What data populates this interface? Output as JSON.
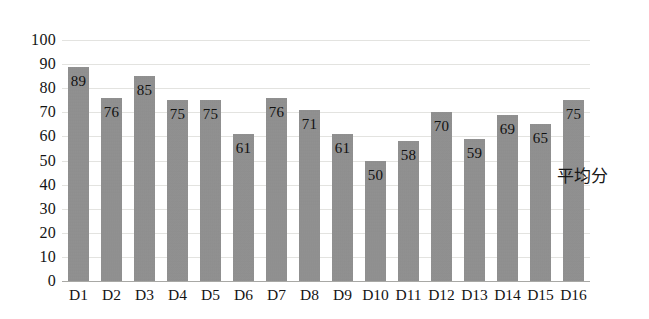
{
  "chart_data": {
    "type": "bar",
    "title": "",
    "subtitle": "",
    "xlabel": "",
    "ylabel": "",
    "categories": [
      "D1",
      "D2",
      "D3",
      "D4",
      "D5",
      "D6",
      "D7",
      "D8",
      "D9",
      "D10",
      "D11",
      "D12",
      "D13",
      "D14",
      "D15",
      "D16"
    ],
    "values": [
      89,
      76,
      85,
      75,
      75,
      61,
      76,
      71,
      61,
      50,
      58,
      70,
      59,
      69,
      65,
      75
    ],
    "series": [
      {
        "name": "平均分",
        "values": [
          89,
          76,
          85,
          75,
          75,
          61,
          76,
          71,
          61,
          50,
          58,
          70,
          59,
          69,
          65,
          75
        ]
      }
    ],
    "ylim": [
      0,
      100
    ],
    "ytick_step": 10,
    "yticks": [
      "100",
      "90",
      "80",
      "70",
      "60",
      "50",
      "40",
      "30",
      "20",
      "10",
      "0"
    ],
    "ytick_values": [
      100,
      90,
      80,
      70,
      60,
      50,
      40,
      30,
      20,
      10,
      0
    ],
    "data_labels_shown": true,
    "grid": true,
    "grid_axis": "y",
    "legend_position": "none",
    "annotations": [
      {
        "text": "平均分",
        "name": "series-annotation"
      }
    ],
    "colors": {
      "bar_fill": "#8e8e8e",
      "gridline": "#e3e3e0",
      "axis_line": "#a8a8a5",
      "text": "#141414",
      "background": "#ffffff"
    }
  }
}
